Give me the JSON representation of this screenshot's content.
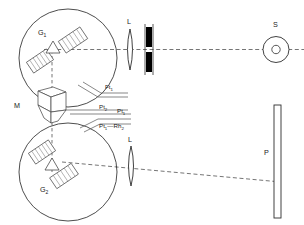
{
  "figure": {
    "background_color": "#ffffff",
    "line_color": "#3a3a3a",
    "dark_color": "#000000",
    "text_color": "#1a1a1a"
  },
  "labels": {
    "grating_upper": {
      "base": "G",
      "sub": "1"
    },
    "grating_lower": {
      "base": "G",
      "sub": "2"
    },
    "mirror": {
      "base": "M",
      "sub": ""
    },
    "lens_upper": {
      "base": "L",
      "sub": ""
    },
    "lens_lower": {
      "base": "L",
      "sub": ""
    },
    "source": {
      "base": "S",
      "sub": ""
    },
    "plate": {
      "base": "P",
      "sub": ""
    }
  },
  "leads": [
    {
      "id": "lead-ft",
      "base": "Ft",
      "sub": "1",
      "tail": "",
      "tail_sub": ""
    },
    {
      "id": "lead-pt-a",
      "base": "Pt",
      "sub": "2",
      "tail": "",
      "tail_sub": ""
    },
    {
      "id": "lead-pt-b",
      "base": "Pt",
      "sub": "1",
      "tail": "",
      "tail_sub": ""
    },
    {
      "id": "lead-pt-rh",
      "base": "Pt",
      "sub": "1",
      "tail": "—Rh",
      "tail_sub": "2"
    }
  ],
  "components": {
    "upper_drum": {
      "name": "grating-drum-upper",
      "cx": 68,
      "cy": 58,
      "r": 49
    },
    "lower_drum": {
      "name": "grating-drum-lower",
      "cx": 68,
      "cy": 172,
      "r": 49
    },
    "slit": {
      "name": "entrance-slit",
      "x": 146,
      "y": 27,
      "w": 6,
      "h": 33
    },
    "source_outer_r": 13,
    "source_inner_r": 4,
    "plate": {
      "name": "photographic-plate",
      "x": 274,
      "y": 105,
      "w": 7,
      "h": 113
    }
  },
  "beams": {
    "upper_axis_label": "upper optical axis",
    "lower_axis_label": "lower optical axis",
    "vertical_axis_label": "vertical coupling axis"
  }
}
